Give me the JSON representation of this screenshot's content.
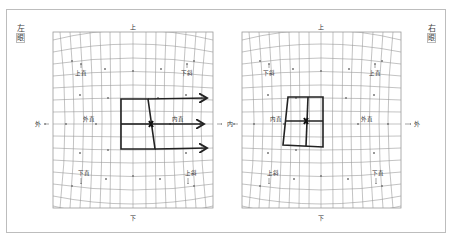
{
  "figure": {
    "left_eye": {
      "label_top": "左",
      "label_bottom": "眼",
      "direction_top": "上",
      "direction_bottom": "下",
      "direction_left": "外",
      "direction_right": "内",
      "muscle_top_left": "上直",
      "muscle_top_right": "下斜",
      "muscle_mid_left": "外直",
      "muscle_mid_right": "内直",
      "muscle_bottom_left": "下直",
      "muscle_bottom_right": "上斜"
    },
    "right_eye": {
      "label_top": "右",
      "label_bottom": "眼",
      "direction_top": "上",
      "direction_bottom": "下",
      "direction_left": "内",
      "direction_right": "外",
      "muscle_top_left": "下斜",
      "muscle_top_right": "上直",
      "muscle_mid_left": "内直",
      "muscle_mid_right": "外直",
      "muscle_bottom_left": "上斜",
      "muscle_bottom_right": "下直"
    },
    "colors": {
      "grid": "#9a9a9a",
      "frame": "#bdbdbd",
      "box": "#222222",
      "text": "#333333"
    }
  }
}
